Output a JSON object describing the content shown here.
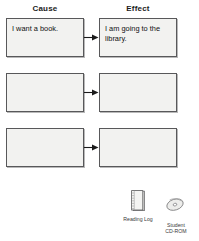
{
  "worksheet": {
    "columns": [
      {
        "key": "cause",
        "label": "Cause"
      },
      {
        "key": "effect",
        "label": "Effect"
      }
    ],
    "rows": [
      {
        "cause": "I want a book.",
        "effect": "I am going to the library."
      },
      {
        "cause": "",
        "effect": ""
      },
      {
        "cause": "",
        "effect": ""
      }
    ],
    "arrow_icon": "arrow-right-icon"
  },
  "resources": [
    {
      "icon": "notebook-icon",
      "label": "Reading Log"
    },
    {
      "icon": "cd-rom-icon",
      "label_line1": "Student",
      "label_line2": "CD-ROM"
    }
  ],
  "colors": {
    "box_fill": "#f2f2f0",
    "box_border": "#58585a",
    "box_shadow": "#b9b9b9",
    "text": "#101010",
    "heading_text": "#1b1b1b",
    "resource_text": "#3a3a3a",
    "page_background": "#ffffff"
  }
}
